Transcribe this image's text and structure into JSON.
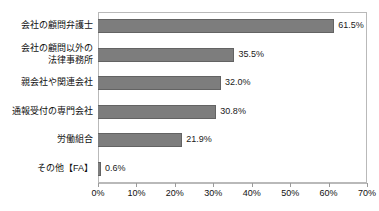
{
  "chart_title": "",
  "chart_data": {
    "type": "bar",
    "orientation": "horizontal",
    "title": "",
    "xlabel": "",
    "ylabel": "",
    "xlim": [
      0,
      70
    ],
    "grid": false,
    "legend": "none",
    "bar_color": "#7d7d7d",
    "bar_border_color": "#636363",
    "plot_border_color": "#b9b9b9",
    "categories": [
      "会社の顧問弁護士",
      "会社の顧問以外の\n法律事務所",
      "親会社や関連会社",
      "通報受付の専門会社",
      "労働組合",
      "その他【FA】"
    ],
    "values": [
      61.5,
      35.5,
      32.0,
      30.8,
      21.9,
      0.6
    ],
    "value_labels": [
      "61.5%",
      "35.5%",
      "32.0%",
      "30.8%",
      "21.9%",
      "0.6%"
    ],
    "xticks": [
      0,
      10,
      20,
      30,
      40,
      50,
      60,
      70
    ],
    "xtick_labels": [
      "0%",
      "10%",
      "20%",
      "30%",
      "40%",
      "50%",
      "60%",
      "70%"
    ]
  }
}
